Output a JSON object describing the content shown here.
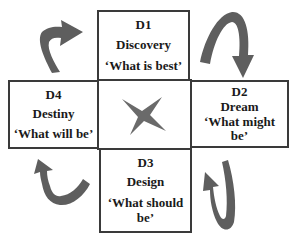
{
  "diagram": {
    "type": "4-D cycle",
    "colors": {
      "border": "#3a3a3a",
      "arrow_fill": "#5e5e5e",
      "star_fill": "#6a6a6a",
      "background": "#ffffff"
    },
    "stages": [
      {
        "code": "D1",
        "name": "Discovery",
        "question": "‘What is best’",
        "position": "top"
      },
      {
        "code": "D2",
        "name": "Dream",
        "question": "‘What might be’",
        "position": "right"
      },
      {
        "code": "D3",
        "name": "Design",
        "question": "‘What should be’",
        "position": "bottom"
      },
      {
        "code": "D4",
        "name": "Destiny",
        "question": "‘What will be’",
        "position": "left"
      }
    ],
    "center_icon": "four-point-star-icon",
    "arrows": [
      {
        "name": "arrow-d1-to-d2",
        "position": "top-right",
        "direction": "clockwise"
      },
      {
        "name": "arrow-d2-to-d3",
        "position": "bottom-right",
        "direction": "clockwise"
      },
      {
        "name": "arrow-d3-to-d4",
        "position": "bottom-left",
        "direction": "clockwise"
      },
      {
        "name": "arrow-d4-to-d1",
        "position": "top-left",
        "direction": "clockwise"
      }
    ]
  }
}
